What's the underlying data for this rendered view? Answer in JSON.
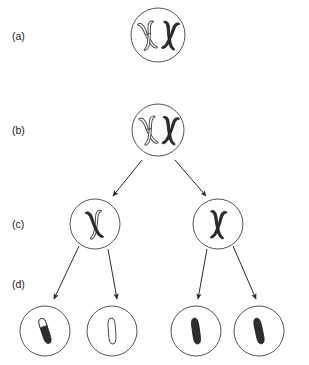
{
  "figure": {
    "width": 309,
    "height": 365,
    "background": "#ffffff"
  },
  "colors": {
    "maternal_chromatid": "#ffffff",
    "paternal_chromatid": "#2e2e2e",
    "outline": "#4a4a4a",
    "membrane": "#555555",
    "arrow": "#2b2b2b",
    "label_text": "#1a1a1a"
  },
  "stages": [
    {
      "id": "a",
      "label": "(a)",
      "label_x": 12,
      "label_y": 40,
      "cells": [
        {
          "name": "cell-a-1",
          "cx": 158,
          "cy": 35,
          "r": 27,
          "chromosomes": [
            {
              "name": "chromosome-light",
              "shape": "x-replicated",
              "shading": "light",
              "cx": 148,
              "cy": 35,
              "tilt": -12
            },
            {
              "name": "chromosome-dark",
              "shape": "x-replicated",
              "shading": "dark",
              "cx": 170,
              "cy": 35,
              "tilt": 8
            }
          ]
        }
      ]
    },
    {
      "id": "b",
      "label": "(b)",
      "label_x": 12,
      "label_y": 134,
      "cells": [
        {
          "name": "cell-b-1",
          "cx": 158,
          "cy": 130,
          "r": 26,
          "chromosomes": [
            {
              "name": "chromosome-light-crossover",
              "shape": "x-replicated",
              "shading": "light",
              "cx": 149,
              "cy": 130,
              "tilt": -10
            },
            {
              "name": "chromosome-dark-crossover",
              "shape": "x-replicated",
              "shading": "dark",
              "cx": 170,
              "cy": 130,
              "tilt": 6
            }
          ]
        }
      ]
    },
    {
      "id": "c",
      "label": "(c)",
      "label_x": 12,
      "label_y": 228,
      "cells": [
        {
          "name": "cell-c-left",
          "cx": 95,
          "cy": 224,
          "r": 25,
          "chromosomes": [
            {
              "name": "chromosome-recombinant",
              "shape": "x-replicated",
              "shading": "mixed",
              "cx": 95,
              "cy": 224,
              "tilt": -8
            }
          ]
        },
        {
          "name": "cell-c-right",
          "cx": 218,
          "cy": 224,
          "r": 25,
          "chromosomes": [
            {
              "name": "chromosome-dark",
              "shape": "x-replicated",
              "shading": "dark",
              "cx": 218,
              "cy": 224,
              "tilt": 4
            }
          ]
        }
      ]
    },
    {
      "id": "d",
      "label": "(d)",
      "label_x": 12,
      "label_y": 288,
      "cells": [
        {
          "name": "gamete-1",
          "cx": 45,
          "cy": 331,
          "r": 25,
          "chromosomes": [
            {
              "name": "chromatid-recombinant",
              "shape": "single-chromatid",
              "shading": "mixed",
              "cx": 45,
              "cy": 331,
              "tilt": -18
            }
          ]
        },
        {
          "name": "gamete-2",
          "cx": 112,
          "cy": 331,
          "r": 25,
          "chromosomes": [
            {
              "name": "chromatid-light",
              "shape": "single-chromatid",
              "shading": "light",
              "cx": 112,
              "cy": 331,
              "tilt": -4
            }
          ]
        },
        {
          "name": "gamete-3",
          "cx": 196,
          "cy": 331,
          "r": 25,
          "chromosomes": [
            {
              "name": "chromatid-dark",
              "shape": "single-chromatid",
              "shading": "dark",
              "cx": 196,
              "cy": 331,
              "tilt": -8
            }
          ]
        },
        {
          "name": "gamete-4",
          "cx": 259,
          "cy": 331,
          "r": 25,
          "chromosomes": [
            {
              "name": "chromatid-dark",
              "shape": "single-chromatid",
              "shading": "dark",
              "cx": 259,
              "cy": 331,
              "tilt": -12
            }
          ]
        }
      ]
    }
  ],
  "arrows": [
    {
      "name": "arrow-b-to-c-left",
      "x1": 142,
      "y1": 160,
      "x2": 113,
      "y2": 196
    },
    {
      "name": "arrow-b-to-c-right",
      "x1": 175,
      "y1": 160,
      "x2": 206,
      "y2": 196
    },
    {
      "name": "arrow-c-to-d-left-1",
      "x1": 79,
      "y1": 246,
      "x2": 54,
      "y2": 299
    },
    {
      "name": "arrow-c-to-d-left-2",
      "x1": 108,
      "y1": 249,
      "x2": 117,
      "y2": 299
    },
    {
      "name": "arrow-c-to-d-right-1",
      "x1": 207,
      "y1": 249,
      "x2": 198,
      "y2": 299
    },
    {
      "name": "arrow-c-to-d-right-2",
      "x1": 233,
      "y1": 246,
      "x2": 256,
      "y2": 299
    }
  ]
}
